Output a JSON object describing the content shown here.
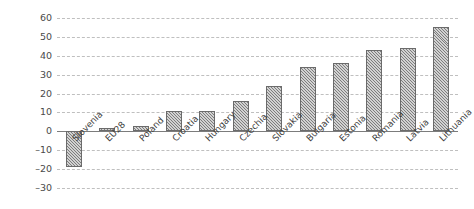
{
  "chart_data": {
    "type": "bar",
    "title": "",
    "subtitle": "",
    "xlabel": "",
    "ylabel": "",
    "categories": [
      "Slovenia",
      "EU28",
      "Poland",
      "Croatia",
      "Hungary",
      "Czechia",
      "Slovakia",
      "Bulgaria",
      "Estonia",
      "Romania",
      "Latvia",
      "Lithuania"
    ],
    "values": [
      -19,
      2,
      3,
      11,
      11,
      16,
      24,
      34,
      36,
      43,
      44,
      55
    ],
    "series": [
      {
        "name": "",
        "values": [
          -19,
          2,
          3,
          11,
          11,
          16,
          24,
          34,
          36,
          43,
          44,
          55
        ]
      }
    ],
    "ylim": [
      -30,
      60
    ],
    "ytick_values": [
      60,
      50,
      40,
      30,
      20,
      10,
      0,
      -10,
      -20,
      -30
    ],
    "ytick_labels": [
      "60",
      "50",
      "40",
      "30",
      "20",
      "10",
      "0",
      "–10",
      "–20",
      "–30"
    ],
    "grid": true,
    "grid_axis": "y",
    "grid_style": "dashed",
    "legend": false,
    "legend_position": "none",
    "bar_fill": "#d2d2d2",
    "bar_pattern": "diagonal-hatch",
    "bar_edge_color": "#6b6b6b",
    "grid_color": "#b9b9b9",
    "zero_line_color": "#7c7c7c",
    "background_color": "#ffffff",
    "tick_label_rotation": -45,
    "annotations": []
  }
}
